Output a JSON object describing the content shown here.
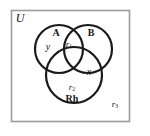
{
  "figure": {
    "kind": "venn-diagram",
    "frame": {
      "border_color": "#9c9c9c",
      "background_color": "#ffffff"
    },
    "stroke_color": "#1a1a1a",
    "text_color": "#161616"
  },
  "labels": {
    "universe": "U",
    "set_a": "A",
    "set_b": "B",
    "set_rh": "Rh",
    "region_y": "y",
    "region_x": "x",
    "region_r1": "r",
    "region_r1_sub": "1",
    "region_r2": "r",
    "region_r2_sub": "2",
    "region_r3": "r",
    "region_r3_sub": "3"
  },
  "geometry": {
    "rect": {
      "x": 11,
      "y": 10,
      "width": 119,
      "height": 112
    },
    "circles": [
      {
        "name": "A",
        "cx": 59,
        "cy": 49,
        "r": 24
      },
      {
        "name": "B",
        "cx": 88,
        "cy": 49,
        "r": 24
      },
      {
        "name": "Rh",
        "cx": 74,
        "cy": 75,
        "r": 28
      }
    ]
  }
}
